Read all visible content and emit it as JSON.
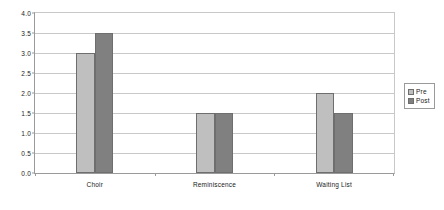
{
  "chart_data": {
    "type": "bar",
    "title": "",
    "subtitle": "",
    "xlabel": "",
    "ylabel": "",
    "categories": [
      "Choir",
      "Reminiscence",
      "Waiting List"
    ],
    "series": [
      {
        "name": "Pre",
        "values": [
          3.0,
          1.5,
          2.0
        ],
        "color": "#bfbfbf"
      },
      {
        "name": "Post",
        "values": [
          3.5,
          1.5,
          1.5
        ],
        "color": "#808080"
      }
    ],
    "ylim": [
      0.0,
      4.0
    ],
    "ytick_step": 0.5,
    "ytick_labels": [
      "0.0",
      "0.5",
      "1.0",
      "1.5",
      "2.0",
      "2.5",
      "3.0",
      "3.5",
      "4.0"
    ],
    "grid": "horizontal",
    "legend_position": "right",
    "annotations": []
  },
  "legend": {
    "entries": [
      {
        "label": "Pre"
      },
      {
        "label": "Post"
      }
    ]
  }
}
